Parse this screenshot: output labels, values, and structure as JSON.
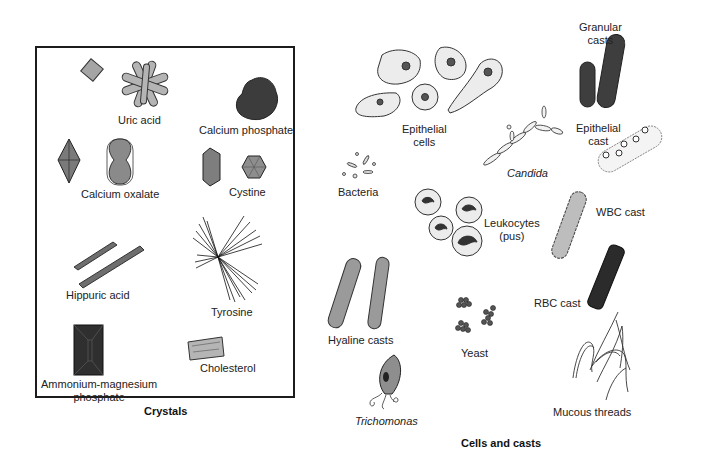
{
  "figure": {
    "panels": [
      {
        "id": "crystals",
        "caption": "Crystals",
        "items": [
          {
            "label": "Uric acid"
          },
          {
            "label": "Calcium phosphate"
          },
          {
            "label": "Calcium oxalate"
          },
          {
            "label": "Cystine"
          },
          {
            "label": "Hippuric acid"
          },
          {
            "label": "Tyrosine"
          },
          {
            "label": "Ammonium-magnesium",
            "label2": "phosphate"
          },
          {
            "label": "Cholesterol"
          }
        ]
      },
      {
        "id": "cells-and-casts",
        "caption": "Cells and casts",
        "items": [
          {
            "label": "Epithelial",
            "label2": "cells"
          },
          {
            "label": "Granular",
            "label2": "casts"
          },
          {
            "label": "Candida",
            "italic": true
          },
          {
            "label": "Epithelial",
            "label2": "cast"
          },
          {
            "label": "Bacteria"
          },
          {
            "label": "Leukocytes",
            "label2": "(pus)"
          },
          {
            "label": "WBC cast"
          },
          {
            "label": "RBC cast"
          },
          {
            "label": "Hyaline casts"
          },
          {
            "label": "Yeast"
          },
          {
            "label": "Trichomonas",
            "italic": true
          },
          {
            "label": "Mucous threads"
          }
        ]
      }
    ],
    "colors": {
      "border": "#1c1c1c",
      "crystal_fill": "#9a9a9a",
      "dark_fill": "#3a3a3a",
      "light_fill": "#e6e6e6",
      "nucleus": "#4a4a4a"
    }
  }
}
